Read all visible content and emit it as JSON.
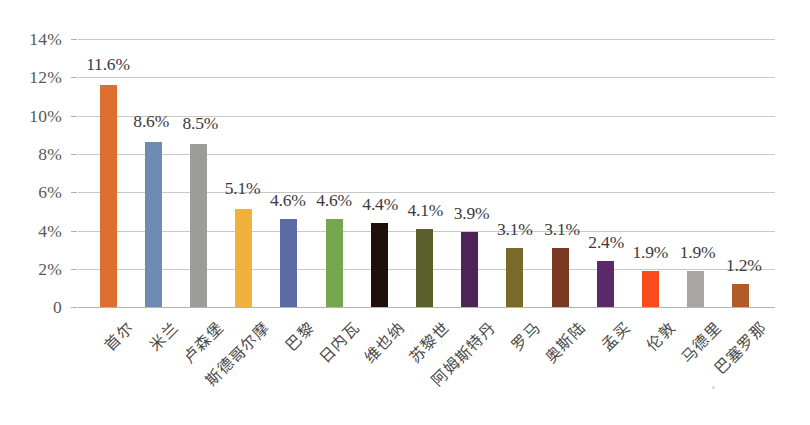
{
  "chart_data": {
    "type": "bar",
    "title": "",
    "subtitle": "",
    "xlabel": "",
    "ylabel": "",
    "ylim": [
      0,
      14
    ],
    "grid": true,
    "legend": false,
    "y_ticks": [
      0,
      2,
      4,
      6,
      8,
      10,
      12,
      14
    ],
    "y_tick_labels": [
      "0",
      "2%",
      "4%",
      "6%",
      "8%",
      "10%",
      "12%",
      "14%"
    ],
    "value_suffix": "%",
    "categories": [
      "首尔",
      "米兰",
      "卢森堡",
      "斯德哥尔摩",
      "巴黎",
      "日内瓦",
      "维也纳",
      "苏黎世",
      "阿姆斯特丹",
      "罗马",
      "奥斯陆",
      "孟买",
      "伦敦",
      "马德里",
      "巴塞罗那"
    ],
    "values": [
      11.6,
      8.6,
      8.5,
      5.1,
      4.6,
      4.6,
      4.4,
      4.1,
      3.9,
      3.1,
      3.1,
      2.4,
      1.9,
      1.9,
      1.2
    ],
    "data_labels": [
      "11.6%",
      "8.6%",
      "8.5%",
      "5.1%",
      "4.6%",
      "4.6%",
      "4.4%",
      "4.1%",
      "3.9%",
      "3.1%",
      "3.1%",
      "2.4%",
      "1.9%",
      "1.9%",
      "1.2%"
    ],
    "bar_colors": [
      "#DD7030",
      "#6E8BB4",
      "#9C9C99",
      "#F0B23C",
      "#5C6BA3",
      "#76A64E",
      "#1E100C",
      "#5B5F2A",
      "#4E2356",
      "#7A6A2A",
      "#7A3A21",
      "#5B2A6B",
      "#FB4C1E",
      "#A8A5A3",
      "#B05C2A"
    ],
    "axis_color": "#c8c8c8",
    "tick_label_color": "#59595b",
    "data_label_color": "#3b3b3b",
    "category_label_color": "#4a4a4a",
    "background": "#ffffff"
  }
}
